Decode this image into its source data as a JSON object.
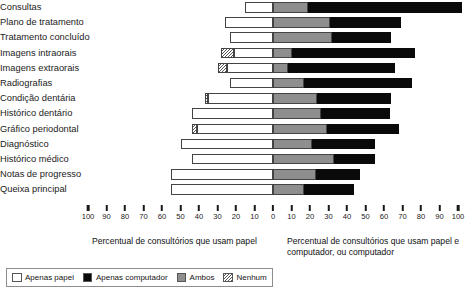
{
  "chart_data": {
    "type": "bar",
    "subtype": "diverging-stacked-horizontal",
    "title": "",
    "xlabel_left": "Percentual de consultórios que usam papel",
    "xlabel_right": "Percentual de consultórios que usam papel e computador, ou computador",
    "ylabel": "",
    "grid": false,
    "legend_position": "bottom-left",
    "xlim_left": [
      0,
      100
    ],
    "xlim_right": [
      0,
      100
    ],
    "xticks_left": [
      "100",
      "90",
      "80",
      "70",
      "60",
      "50",
      "40",
      "30",
      "20",
      "10",
      "0"
    ],
    "xticks_right": [
      "0",
      "10",
      "20",
      "30",
      "40",
      "50",
      "60",
      "70",
      "80",
      "90",
      "100"
    ],
    "zero_position_percent": 50,
    "categories": [
      "Consultas",
      "Plano de tratamento",
      "Tratamento concluído",
      "Imagens intraorais",
      "Imagens extraorais",
      "Radiografias",
      "Condição dentária",
      "Histórico dentário",
      "Gráfico periodontal",
      "Diagnóstico",
      "Histórico médico",
      "Notas de progresso",
      "Queixa principal"
    ],
    "series": [
      {
        "name": "Nenhum",
        "color": "#ffffff-hatch",
        "values": [
          0,
          0,
          0,
          7,
          5,
          0,
          2,
          0,
          3,
          0,
          0,
          0,
          0
        ]
      },
      {
        "name": "Apenas papel",
        "color": "#ffffff",
        "values": [
          15,
          26,
          23,
          21,
          25,
          23,
          35,
          44,
          41,
          50,
          44,
          55,
          55
        ]
      },
      {
        "name": "Ambos",
        "color": "#8e8e8e",
        "values": [
          19,
          31,
          32,
          10,
          8,
          17,
          24,
          26,
          29,
          21,
          33,
          23,
          17
        ]
      },
      {
        "name": "Apenas computador",
        "color": "#0a0a0a",
        "values": [
          83,
          38,
          32,
          67,
          58,
          58,
          40,
          37,
          39,
          34,
          22,
          24,
          27
        ]
      }
    ]
  },
  "axis": {
    "left_title": "Percentual de consultórios que usam papel",
    "right_title": "Percentual de consultórios que usam papel e computador, ou computador",
    "ticks_left": [
      "100",
      "90",
      "80",
      "70",
      "60",
      "50",
      "40",
      "30",
      "20",
      "10",
      "0"
    ],
    "ticks_right": [
      "10",
      "20",
      "30",
      "40",
      "50",
      "60",
      "70",
      "80",
      "90",
      "100"
    ]
  },
  "legend": {
    "items": [
      {
        "label": "Apenas papel",
        "swatch": "white-swatch"
      },
      {
        "label": "Apenas computador",
        "swatch": "black-swatch"
      },
      {
        "label": "Ambos",
        "swatch": "gray-swatch"
      },
      {
        "label": "Nenhum",
        "swatch": "hatched-swatch"
      }
    ]
  }
}
